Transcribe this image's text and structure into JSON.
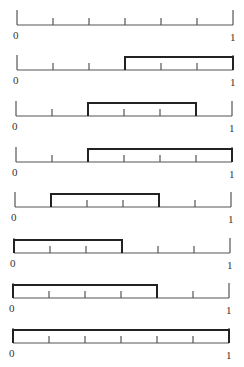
{
  "diagram": {
    "axis": {
      "min_label": "0",
      "max_label": "1",
      "divisions": 6
    },
    "line_color": "#555555",
    "box_color": "#222222",
    "rows": [
      {
        "index": 1,
        "baseline_y": 25,
        "x_left": 17,
        "x_right": 233,
        "box": null
      },
      {
        "index": 2,
        "baseline_y": 70,
        "x_left": 17,
        "x_right": 233,
        "box": [
          0.5,
          1.0
        ]
      },
      {
        "index": 3,
        "baseline_y": 116,
        "x_left": 16,
        "x_right": 232,
        "box": [
          0.3333,
          0.8333
        ]
      },
      {
        "index": 4,
        "baseline_y": 162,
        "x_left": 16,
        "x_right": 232,
        "box": [
          0.3333,
          1.0
        ]
      },
      {
        "index": 5,
        "baseline_y": 207,
        "x_left": 15,
        "x_right": 231,
        "box": [
          0.1667,
          0.6667
        ]
      },
      {
        "index": 6,
        "baseline_y": 253,
        "x_left": 14,
        "x_right": 230,
        "box": [
          0.0,
          0.5
        ]
      },
      {
        "index": 7,
        "baseline_y": 298,
        "x_left": 13,
        "x_right": 229,
        "box": [
          0.0,
          0.6667
        ]
      },
      {
        "index": 8,
        "baseline_y": 343,
        "x_left": 13,
        "x_right": 229,
        "box": [
          0.0,
          1.0
        ]
      }
    ]
  }
}
